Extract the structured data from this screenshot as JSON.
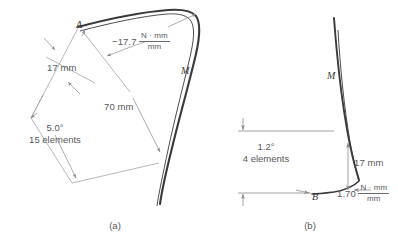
{
  "figure": {
    "background_color": "#ffffff",
    "line_color": "#8c8c8e",
    "curve_color": "#3a3a3c",
    "text_color": "#58585a"
  },
  "panel_a": {
    "caption": "(a)",
    "point_label": "A",
    "moment_label": "M",
    "moment_value": "−17.7",
    "moment_unit_numerator": "N · mm",
    "moment_unit_denominator": "mm",
    "thickness_dim": "17 mm",
    "length_dim": "70 mm",
    "rotation_angle": "5.0°",
    "element_count": "15 elements"
  },
  "panel_b": {
    "caption": "(b)",
    "point_label": "B",
    "moment_label": "M",
    "moment_value": "1.70",
    "moment_unit_numerator": "N · mm",
    "moment_unit_denominator": "mm",
    "thickness_dim": "17 mm",
    "rotation_angle": "1.2°",
    "element_count": "4 elements"
  }
}
